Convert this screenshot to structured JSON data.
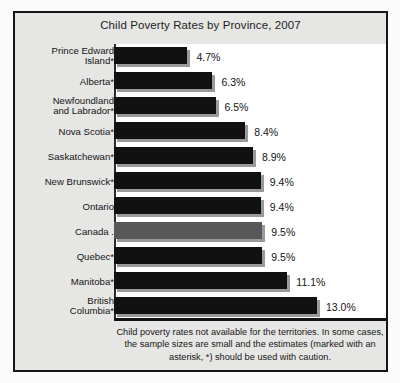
{
  "chart_data": {
    "type": "bar",
    "orientation": "horizontal",
    "title": "Child Poverty Rates by Province, 2007",
    "xlabel": "",
    "ylabel": "",
    "xlim": [
      0,
      13.5
    ],
    "grid": false,
    "legend": "none",
    "value_suffix": "%",
    "highlight_category": "Canada",
    "categories": [
      "Prince Edward Island*",
      "Alberta*",
      "Newfoundland and Labrador*",
      "Nova Scotia*",
      "Saskatchewan*",
      "New Brunswick*",
      "Ontario",
      "Canada",
      "Quebec*",
      "Manitoba*",
      "British Columbia*"
    ],
    "values": [
      4.7,
      6.3,
      6.5,
      8.4,
      8.9,
      9.4,
      9.4,
      9.5,
      9.5,
      11.1,
      13.0
    ],
    "value_labels": [
      "4.7%",
      "6.3%",
      "6.5%",
      "8.4%",
      "8.9%",
      "9.4%",
      "9.4%",
      "9.5%",
      "9.5%",
      "11.1%",
      "13.0%"
    ],
    "category_labels_wrapped": [
      "Prince Edward\nIsland*",
      "Alberta*",
      "Newfoundland\nand Labrador*",
      "Nova Scotia*",
      "Saskatchewan*",
      "New Brunswick*",
      "Ontario",
      "Canada .",
      "Quebec*",
      "Manitoba*",
      "British\nColumbia*"
    ],
    "colors": {
      "bar": "#111111",
      "bar_highlight": "#585858",
      "bar_shadow": "#9a9a9a",
      "frame_border": "#161616",
      "frame_background": "#e6e6e4",
      "plot_background": "#ffffff",
      "text": "#151515"
    }
  },
  "footnote": {
    "text": "Child poverty rates not available for the territories. In some cases, the sample sizes are small and the estimates (marked with an asterisk, *) should be used with caution."
  }
}
